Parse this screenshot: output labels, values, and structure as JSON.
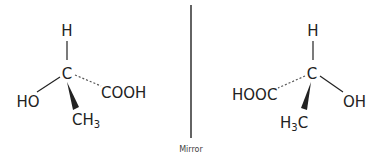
{
  "diagram": {
    "colors": {
      "ink": "#222222",
      "label": "#444444",
      "background": "#ffffff"
    },
    "mirror": {
      "label": "Mirror"
    },
    "left_molecule": {
      "center": "C",
      "top": "H",
      "left": "HO",
      "right_dashed": "COOH",
      "bottom_wedge_base": "CH",
      "bottom_wedge_sub": "3"
    },
    "right_molecule": {
      "center": "C",
      "top": "H",
      "left_dashed": "HOOC",
      "right": "OH",
      "bottom_wedge_pre": "H",
      "bottom_wedge_sub": "3",
      "bottom_wedge_post": "C"
    }
  }
}
